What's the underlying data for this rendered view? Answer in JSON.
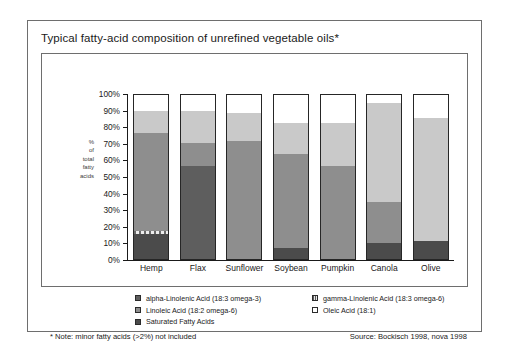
{
  "chart_data": {
    "type": "bar",
    "stacked": true,
    "title": "Typical fatty-acid composition of unrefined vegetable oils*",
    "xlabel": "",
    "ylabel": "% of total fatty acids",
    "ylabel_lines": [
      "%",
      "of",
      "total",
      "fatty",
      "acids"
    ],
    "ylim": [
      0,
      100
    ],
    "ytick_labels": [
      "0%",
      "10%",
      "20%",
      "30%",
      "40%",
      "50%",
      "60%",
      "70%",
      "80%",
      "90%",
      "100%"
    ],
    "ytick_values": [
      0,
      10,
      20,
      30,
      40,
      50,
      60,
      70,
      80,
      90,
      100
    ],
    "grid": false,
    "legend_position": "below",
    "categories": [
      "Hemp",
      "Flax",
      "Sunflower",
      "Soybean",
      "Pumpkin",
      "Canola",
      "Olive"
    ],
    "series": [
      {
        "name": "Saturated Fatty Acids",
        "key": "sat",
        "color": "#4b4b4b",
        "values": [
          15,
          0,
          0,
          7,
          0,
          10,
          11
        ]
      },
      {
        "name": "gamma-Linolenic Acid (18:3 omega-6)",
        "key": "gamma",
        "color": "#d8d8d8",
        "values": [
          2,
          0,
          0,
          0,
          0,
          0,
          0
        ]
      },
      {
        "name": "alpha-Linolenic Acid (18:3 omega-3)",
        "key": "alpha",
        "color": "#5e5e5e",
        "values": [
          0,
          57,
          0,
          0,
          0,
          0,
          0
        ]
      },
      {
        "name": "Linoleic Acid (18:2 omega-6)",
        "key": "linoleic",
        "color": "#8e8e8e",
        "values": [
          60,
          14,
          72,
          57,
          57,
          25,
          0
        ]
      },
      {
        "name": "Oleic Acid (18:1)",
        "key": "oleic",
        "color": "#c9c9c9",
        "values": [
          13,
          19,
          17,
          19,
          26,
          60,
          75
        ]
      },
      {
        "name": "unassigned",
        "key": "blank",
        "color": "#ffffff",
        "values": [
          10,
          10,
          11,
          17,
          17,
          5,
          14
        ]
      }
    ]
  },
  "header": {
    "title": "Typical fatty-acid composition of unrefined vegetable oils*"
  },
  "axis": {
    "y_title_lines": [
      "%",
      "of",
      "total",
      "fatty",
      "acids"
    ],
    "y_ticks": [
      "100%",
      "90%",
      "80%",
      "70%",
      "60%",
      "50%",
      "40%",
      "30%",
      "20%",
      "10%",
      "0%"
    ]
  },
  "legend": {
    "column_left": [
      {
        "label": "alpha-Linolenic Acid (18:3 omega-3)",
        "swatch": "sw-alpha"
      },
      {
        "label": "Linoleic Acid (18:2 omega-6)",
        "swatch": "sw-linoleic"
      },
      {
        "label": "Saturated Fatty Acids",
        "swatch": "sw-sat"
      }
    ],
    "column_right": [
      {
        "label": "gamma-Linolenic Acid (18:3 omega-6)",
        "swatch": "sw-gamma"
      },
      {
        "label": "Oleic Acid (18:1)",
        "swatch": "sw-oleic"
      }
    ]
  },
  "footer": {
    "note": "* Note: minor fatty acids (>2%) not included",
    "source": "Source: Bockisch 1998, nova 1998"
  }
}
